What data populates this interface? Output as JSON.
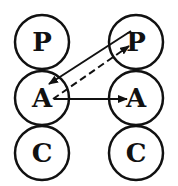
{
  "diagram": {
    "left_column": {
      "nodes": [
        {
          "label": "P"
        },
        {
          "label": "A"
        },
        {
          "label": "C"
        }
      ]
    },
    "right_column": {
      "nodes": [
        {
          "label": "P"
        },
        {
          "label": "A"
        },
        {
          "label": "C"
        }
      ]
    },
    "edges": [
      {
        "from": "right.P",
        "to": "left.A",
        "style": "solid"
      },
      {
        "from": "left.A",
        "to": "right.P",
        "style": "dashed"
      },
      {
        "from": "left.A",
        "to": "right.A",
        "style": "solid"
      }
    ],
    "colors": {
      "stroke": "#111111",
      "background": "#ffffff"
    }
  }
}
